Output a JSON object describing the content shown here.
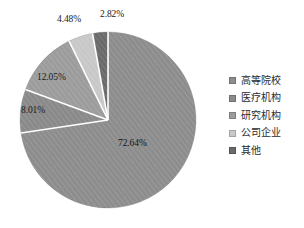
{
  "chart_data": {
    "type": "pie",
    "title": "",
    "subtitle": "",
    "xlabel": "",
    "ylabel": "",
    "grid": false,
    "legend_position": "right",
    "unit": "%",
    "start_angle_deg": 0,
    "direction": "clockwise",
    "categories": [
      "高等院校",
      "医疗机构",
      "研究机构",
      "公司企业",
      "其他"
    ],
    "values": [
      72.64,
      8.01,
      12.05,
      4.48,
      2.82
    ],
    "labels": [
      "72.64%",
      "8.01%",
      "12.05%",
      "4.48%",
      "2.82%"
    ],
    "colors": [
      "#8d8d8d",
      "#8a8a8a",
      "#9c9c9c",
      "#c8c8c8",
      "#6a6a6a"
    ],
    "slices": [
      {
        "name": "高等院校",
        "value": 72.64,
        "label": "72.64%",
        "color": "#8d8d8d",
        "label_pos": {
          "x": 118,
          "y": 138
        }
      },
      {
        "name": "医疗机构",
        "value": 8.01,
        "label": "8.01%",
        "color": "#8a8a8a",
        "label_pos": {
          "x": 21,
          "y": 105
        }
      },
      {
        "name": "研究机构",
        "value": 12.05,
        "label": "12.05%",
        "color": "#9c9c9c",
        "label_pos": {
          "x": 37,
          "y": 72
        }
      },
      {
        "name": "公司企业",
        "value": 4.48,
        "label": "4.48%",
        "color": "#c8c8c8",
        "label_pos": {
          "x": 57,
          "y": 14
        }
      },
      {
        "name": "其他",
        "value": 2.82,
        "label": "2.82%",
        "color": "#6a6a6a",
        "label_pos": {
          "x": 100,
          "y": 9
        }
      }
    ],
    "geometry": {
      "center_x": 108,
      "center_y": 120,
      "radius": 88,
      "separator_color": "#ffffff",
      "separator_width": 1.6,
      "hatch": "diagonal"
    }
  },
  "legend": {
    "items": [
      {
        "label": "高等院校",
        "color": "#8d8d8d"
      },
      {
        "label": "医疗机构",
        "color": "#8a8a8a"
      },
      {
        "label": "研究机构",
        "color": "#9c9c9c"
      },
      {
        "label": "公司企业",
        "color": "#c8c8c8"
      },
      {
        "label": "其他",
        "color": "#6a6a6a"
      }
    ]
  }
}
